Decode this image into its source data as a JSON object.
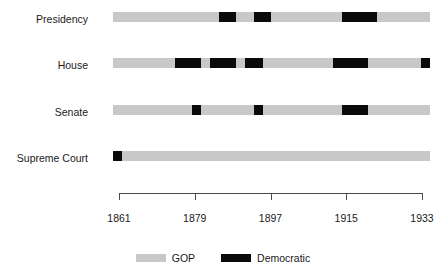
{
  "chart_data": {
    "type": "bar",
    "title": "",
    "subtitle": "",
    "xlabel": "",
    "ylabel": "",
    "orientation": "horizontal-timeline",
    "xlim": [
      1861,
      1933
    ],
    "xticks": [
      1861,
      1879,
      1897,
      1915,
      1933
    ],
    "xtick_labels": [
      "1861",
      "1879",
      "1897",
      "1915",
      "1933"
    ],
    "grid": false,
    "legend_position": "bottom-center",
    "categories": [
      "Presidency",
      "House",
      "Senate",
      "Supreme Court"
    ],
    "series": [
      {
        "name": "GOP",
        "color": "#c8c8c8"
      },
      {
        "name": "Democratic",
        "color": "#0a0a0a"
      }
    ],
    "rows": [
      {
        "label": "Presidency",
        "default_party": "GOP",
        "democratic_spans": [
          {
            "start": 1885,
            "end": 1889
          },
          {
            "start": 1893,
            "end": 1897
          },
          {
            "start": 1913,
            "end": 1921
          }
        ]
      },
      {
        "label": "House",
        "default_party": "GOP",
        "democratic_spans": [
          {
            "start": 1875,
            "end": 1881
          },
          {
            "start": 1883,
            "end": 1889
          },
          {
            "start": 1891,
            "end": 1895
          },
          {
            "start": 1911,
            "end": 1919
          },
          {
            "start": 1931,
            "end": 1933
          }
        ]
      },
      {
        "label": "Senate",
        "default_party": "GOP",
        "democratic_spans": [
          {
            "start": 1879,
            "end": 1881
          },
          {
            "start": 1893,
            "end": 1895
          },
          {
            "start": 1913,
            "end": 1919
          }
        ]
      },
      {
        "label": "Supreme Court",
        "default_party": "GOP",
        "democratic_spans": [
          {
            "start": 1861,
            "end": 1863
          }
        ]
      }
    ]
  },
  "legend": {
    "items": [
      {
        "label": "GOP",
        "color": "#c8c8c8"
      },
      {
        "label": "Democratic",
        "color": "#0a0a0a"
      }
    ]
  }
}
